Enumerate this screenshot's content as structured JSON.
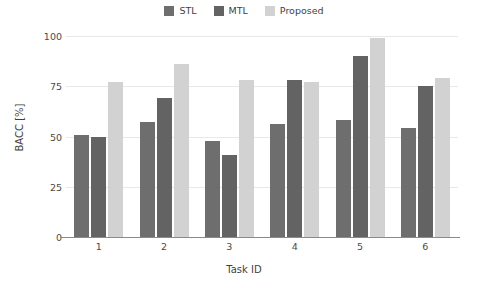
{
  "chart_data": {
    "type": "bar",
    "title": "",
    "xlabel": "Task ID",
    "ylabel": "BACC [%]",
    "categories": [
      "1",
      "2",
      "3",
      "4",
      "5",
      "6"
    ],
    "series": [
      {
        "name": "STL",
        "color": "#6e6e6e",
        "values": [
          51,
          57,
          48,
          56,
          58,
          54
        ]
      },
      {
        "name": "MTL",
        "color": "#636363",
        "values": [
          50,
          69,
          41,
          78,
          90,
          75
        ]
      },
      {
        "name": "Proposed",
        "color": "#d2d2d2",
        "values": [
          77,
          86,
          78,
          77,
          99,
          79
        ]
      }
    ],
    "ylim": [
      0,
      100
    ],
    "yticks": [
      0,
      25,
      50,
      75,
      100
    ],
    "ytick_labels": [
      "0",
      "25",
      "50",
      "75",
      "100"
    ],
    "grid": true,
    "grid_axis": "y",
    "grid_color": "#e8e8e8",
    "legend_position": "top-center",
    "axis_color": "#8a8a8a",
    "background": "#ffffff"
  }
}
